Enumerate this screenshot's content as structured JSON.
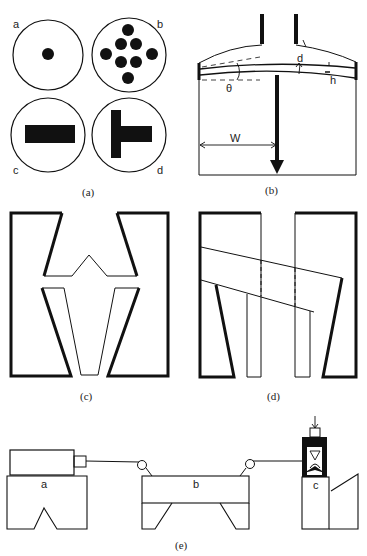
{
  "figure": {
    "panels": {
      "a": {
        "caption": "(a)",
        "circles": [
          {
            "label": "a",
            "content": "single small dot"
          },
          {
            "label": "b",
            "content": "eight dots in diamond pattern"
          },
          {
            "label": "c",
            "content": "horizontal bar"
          },
          {
            "label": "d",
            "content": "T-shape rotated"
          }
        ]
      },
      "b": {
        "caption": "(b)",
        "labels": {
          "d": "d",
          "h": "h",
          "theta": "θ",
          "W": "W"
        }
      },
      "c": {
        "caption": "(c)"
      },
      "d": {
        "caption": "(d)"
      },
      "e": {
        "caption": "(e)",
        "labels": {
          "a": "a",
          "b": "b",
          "c": "c"
        }
      }
    }
  }
}
